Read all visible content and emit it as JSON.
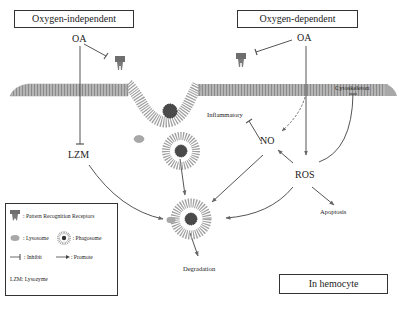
{
  "diagram": {
    "boxes": {
      "oxygen_independent": "Oxygen-independent",
      "oxygen_dependent": "Oxygen-dependent",
      "location": "In hemocyte"
    },
    "nodes": {
      "oa_left": "OA",
      "oa_right": "OA",
      "lzm": "LZM",
      "no": "NO",
      "ros": "ROS",
      "inflammatory": "Inflammatory",
      "cytoskeleton": "Cytoskeleton",
      "apoptosis": "Apoptosis",
      "degradation": "Degradation"
    },
    "edges": [
      {
        "from": "OA (left)",
        "to": "Pattern Recognition Receptor (left)",
        "type": "inhibit"
      },
      {
        "from": "OA (left)",
        "to": "LZM",
        "type": "inhibit"
      },
      {
        "from": "OA (right)",
        "to": "Pattern Recognition Receptor (right)",
        "type": "inhibit"
      },
      {
        "from": "OA (right)",
        "to": "ROS",
        "type": "promote"
      },
      {
        "from": "OA (right)",
        "to": "NO",
        "type": "promote-dashed"
      },
      {
        "from": "NO",
        "to": "Inflammatory",
        "type": "inhibit"
      },
      {
        "from": "ROS",
        "to": "NO",
        "type": "promote"
      },
      {
        "from": "ROS",
        "to": "Cytoskeleton",
        "type": "inhibit"
      },
      {
        "from": "ROS",
        "to": "Apoptosis",
        "type": "promote"
      },
      {
        "from": "ROS",
        "to": "Phagolysosome",
        "type": "promote"
      },
      {
        "from": "NO",
        "to": "Phagolysosome",
        "type": "promote"
      },
      {
        "from": "LZM",
        "to": "Phagolysosome",
        "type": "promote"
      },
      {
        "from": "Phagosome",
        "to": "Phagolysosome",
        "type": "promote"
      },
      {
        "from": "Phagolysosome",
        "to": "Degradation",
        "type": "promote"
      }
    ],
    "colors": {
      "membrane": "#9a9a9a",
      "receptor": "#6e6e6e",
      "pathogen": "#4a4a4a",
      "line": "#555555"
    }
  },
  "legend": {
    "prr": ": Pattern  Recognition  Receptors",
    "lysosome": ": Lysosome",
    "phagosome": ": Phagosome",
    "inhibit": ": Inhibit",
    "promote": ": Promote",
    "lzm": "LZM: Lysozyme"
  }
}
